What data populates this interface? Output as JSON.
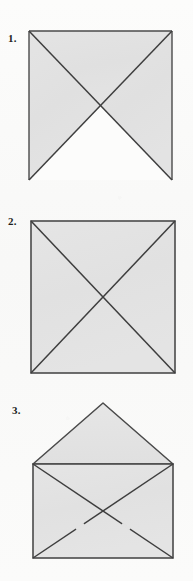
{
  "document": {
    "kind": "instructional-diagram",
    "subject": "paper folding steps",
    "background_color": "#fbfbfa",
    "ink_color": "#3a3a3a",
    "fill_color": "#e2e2e2",
    "steps_count": 3
  },
  "steps": [
    {
      "label": "1.",
      "name": "square-with-open-bottom-triangle",
      "shape": "square",
      "crease_lines": "both-diagonals",
      "filled_regions": [
        "top",
        "left",
        "right"
      ],
      "unfilled_regions": [
        "bottom"
      ],
      "geometry": {
        "x": 29,
        "y": 31,
        "width": 143,
        "height": 149
      }
    },
    {
      "label": "2.",
      "name": "square-fully-creased",
      "shape": "square",
      "crease_lines": "both-diagonals",
      "filled_regions": [
        "top",
        "left",
        "right",
        "bottom"
      ],
      "unfilled_regions": [],
      "geometry": {
        "x": 31,
        "y": 221,
        "width": 144,
        "height": 152
      }
    },
    {
      "label": "3.",
      "name": "envelope-with-open-flap",
      "shape": "envelope",
      "crease_lines": "both-diagonals",
      "flap": "open-upward-triangle",
      "fold_marks": 2,
      "geometry": {
        "x": 33,
        "y": 464,
        "width": 140,
        "height": 94,
        "flap_apex_x": 103,
        "flap_apex_y": 403
      }
    }
  ],
  "colors": {
    "paper_fill": "#e2e2e2",
    "paper_fill_light": "#e6e6e6",
    "line": "#3e3e3e",
    "line_soft": "#555555",
    "background": "#fbfbfa",
    "label_text": "#1d1d1d"
  }
}
